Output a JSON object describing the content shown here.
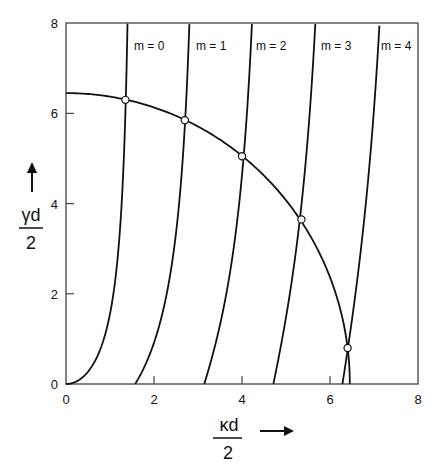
{
  "chart_data": {
    "type": "line",
    "title": "",
    "xlabel": "κd/2",
    "ylabel": "γd/2",
    "xlim": [
      0,
      8
    ],
    "ylim": [
      0,
      8
    ],
    "x_ticks": [
      "0",
      "2",
      "4",
      "6",
      "8"
    ],
    "y_ticks": [
      "0",
      "2",
      "4",
      "6",
      "8"
    ],
    "grid": false,
    "legend": "none",
    "circle_radius": 6.45,
    "series": [
      {
        "name": "m = 0",
        "start_x": 0.0,
        "parity": "even"
      },
      {
        "name": "m = 1",
        "start_x": 1.571,
        "parity": "odd"
      },
      {
        "name": "m = 2",
        "start_x": 3.142,
        "parity": "even"
      },
      {
        "name": "m = 3",
        "start_x": 4.712,
        "parity": "odd"
      },
      {
        "name": "m = 4",
        "start_x": 6.283,
        "parity": "even"
      }
    ],
    "intersections": [
      {
        "m": 0,
        "x": 1.35,
        "y": 6.3
      },
      {
        "m": 1,
        "x": 2.7,
        "y": 5.85
      },
      {
        "m": 2,
        "x": 4.0,
        "y": 5.05
      },
      {
        "m": 3,
        "x": 5.35,
        "y": 3.65
      },
      {
        "m": 4,
        "x": 6.4,
        "y": 0.8
      }
    ]
  },
  "labels": {
    "m0": "m = 0",
    "m1": "m = 1",
    "m2": "m = 2",
    "m3": "m = 3",
    "m4": "m = 4",
    "x_num": "κd",
    "x_den": "2",
    "y_num": "γd",
    "y_den": "2",
    "xt0": "0",
    "xt2": "2",
    "xt4": "4",
    "xt6": "6",
    "xt8": "8",
    "yt0": "0",
    "yt2": "2",
    "yt4": "4",
    "yt6": "6",
    "yt8": "8"
  }
}
